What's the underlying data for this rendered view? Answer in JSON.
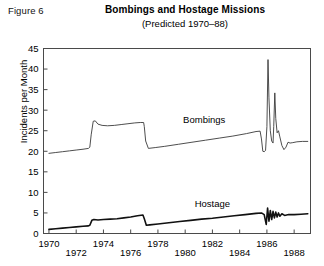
{
  "figure": {
    "label": "Figure 6",
    "title": "Bombings and Hostage Missions",
    "subtitle": "(Predicted 1970–88)"
  },
  "chart_data": {
    "type": "line",
    "title": "Bombings and Hostage Missions",
    "subtitle": "(Predicted 1970–88)",
    "xlabel": "",
    "ylabel": "Incidents per Month",
    "xlim": [
      1969.6,
      1989.2
    ],
    "ylim": [
      0,
      45
    ],
    "yticks": [
      0,
      5,
      10,
      15,
      20,
      25,
      30,
      35,
      40,
      45
    ],
    "xticks": [
      1970,
      1972,
      1974,
      1976,
      1978,
      1980,
      1982,
      1984,
      1986,
      1988
    ],
    "xtick_labels": [
      "1970",
      "1972",
      "1974",
      "1976",
      "1978",
      "1980",
      "1982",
      "1984",
      "1986",
      "1988"
    ],
    "ytick_labels": [
      "0",
      "5",
      "10",
      "15",
      "20",
      "25",
      "30",
      "35",
      "40",
      "45"
    ],
    "grid": false,
    "legend_position": "inline-annotations",
    "annotations": [
      {
        "text": "Bombings",
        "x": 1981.4,
        "y": 26.8
      },
      {
        "text": "Hostage",
        "x": 1982.0,
        "y": 6.4
      }
    ],
    "series": [
      {
        "name": "Bombings",
        "x": [
          1970.0,
          1970.5,
          1971.0,
          1971.5,
          1972.0,
          1972.5,
          1972.9,
          1973.0,
          1973.1,
          1973.25,
          1973.4,
          1973.6,
          1973.9,
          1974.3,
          1974.8,
          1975.3,
          1975.8,
          1976.3,
          1976.7,
          1976.95,
          1977.0,
          1977.1,
          1977.3,
          1977.8,
          1978.5,
          1979.5,
          1980.5,
          1981.5,
          1982.5,
          1983.5,
          1984.5,
          1985.2,
          1985.5,
          1985.6,
          1985.7,
          1985.8,
          1985.9,
          1986.0,
          1986.08,
          1986.15,
          1986.25,
          1986.35,
          1986.45,
          1986.5,
          1986.58,
          1986.65,
          1986.75,
          1986.85,
          1986.95,
          1987.1,
          1987.25,
          1987.4,
          1987.55,
          1987.7,
          1987.9,
          1988.2,
          1988.6,
          1989.0
        ],
        "y": [
          19.5,
          19.7,
          19.9,
          20.1,
          20.3,
          20.5,
          20.7,
          21.0,
          24.0,
          27.3,
          27.4,
          26.6,
          26.3,
          26.2,
          26.3,
          26.5,
          26.7,
          26.9,
          27.0,
          27.0,
          26.0,
          22.5,
          20.7,
          20.9,
          21.2,
          21.7,
          22.2,
          22.7,
          23.2,
          23.7,
          24.3,
          24.8,
          24.9,
          23.0,
          20.0,
          19.9,
          20.2,
          26.0,
          42.3,
          33.0,
          25.0,
          22.5,
          22.0,
          26.0,
          34.2,
          28.0,
          24.5,
          25.0,
          23.5,
          21.4,
          20.4,
          21.0,
          22.2,
          22.0,
          22.1,
          22.3,
          22.4,
          22.4
        ]
      },
      {
        "name": "Hostage",
        "x": [
          1970.0,
          1970.5,
          1971.0,
          1971.5,
          1972.0,
          1972.5,
          1972.9,
          1973.0,
          1973.15,
          1973.3,
          1973.6,
          1974.0,
          1974.5,
          1975.0,
          1975.5,
          1976.0,
          1976.5,
          1976.9,
          1977.0,
          1977.15,
          1977.4,
          1978.0,
          1978.8,
          1979.6,
          1980.4,
          1981.2,
          1982.0,
          1982.8,
          1983.6,
          1984.4,
          1985.2,
          1985.6,
          1985.8,
          1985.95,
          1986.05,
          1986.15,
          1986.25,
          1986.35,
          1986.45,
          1986.55,
          1986.65,
          1986.75,
          1986.85,
          1986.95,
          1987.1,
          1987.3,
          1987.6,
          1988.0,
          1988.5,
          1989.0
        ],
        "y": [
          1.0,
          1.15,
          1.3,
          1.45,
          1.6,
          1.75,
          1.85,
          2.0,
          3.2,
          3.4,
          3.3,
          3.4,
          3.5,
          3.6,
          3.8,
          4.0,
          4.3,
          4.5,
          3.6,
          2.0,
          2.1,
          2.3,
          2.6,
          2.9,
          3.2,
          3.5,
          3.7,
          4.0,
          4.3,
          4.6,
          4.9,
          5.0,
          4.6,
          2.2,
          6.2,
          3.0,
          5.6,
          3.4,
          5.4,
          3.8,
          5.2,
          4.0,
          5.0,
          4.2,
          4.8,
          4.4,
          4.6,
          4.6,
          4.7,
          4.8
        ]
      }
    ]
  }
}
